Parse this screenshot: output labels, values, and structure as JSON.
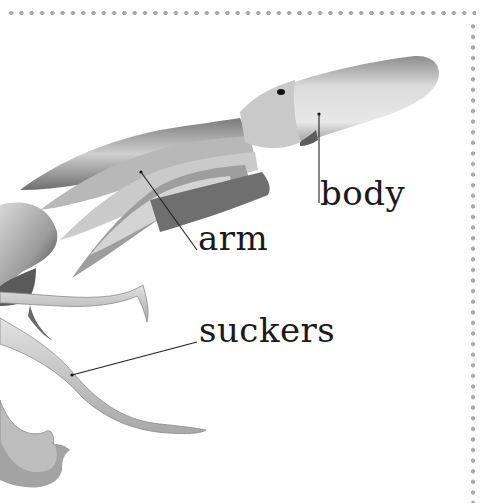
{
  "illustration": {
    "subject": "squid",
    "labels": [
      {
        "id": "body",
        "text": "body"
      },
      {
        "id": "arm",
        "text": "arm"
      },
      {
        "id": "suckers",
        "text": "suckers"
      }
    ]
  },
  "colors": {
    "border_dots": "#a9a9a9",
    "label_text": "#1a1a1a",
    "leader_line": "#222222"
  }
}
